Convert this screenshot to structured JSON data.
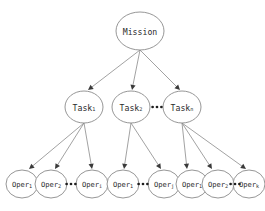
{
  "diagram": {
    "type": "hierarchy-tree",
    "levels": 3,
    "root": {
      "id": "mission",
      "label": "Mission",
      "base": "Mission",
      "sub": "",
      "cx": 140,
      "cy": 31,
      "rx": 24,
      "ry": 19
    },
    "tasks": [
      {
        "id": "task-1",
        "base": "Task",
        "sub": "1",
        "cx": 84,
        "cy": 107,
        "rx": 19,
        "ry": 16
      },
      {
        "id": "task-2",
        "base": "Task",
        "sub": "2",
        "cx": 131,
        "cy": 107,
        "rx": 19,
        "ry": 16
      },
      {
        "id": "task-n",
        "base": "Task",
        "sub": "n",
        "cx": 182,
        "cy": 107,
        "rx": 19,
        "ry": 16
      }
    ],
    "operations": [
      {
        "id": "oper-1-1",
        "base": "Oper",
        "sub": "1",
        "cx": 22,
        "cy": 184,
        "rx": 16,
        "ry": 14,
        "group": 1
      },
      {
        "id": "oper-1-2",
        "base": "Oper",
        "sub": "2",
        "cx": 51,
        "cy": 184,
        "rx": 16,
        "ry": 14,
        "group": 1
      },
      {
        "id": "oper-1-i",
        "base": "Oper",
        "sub": "i",
        "cx": 92,
        "cy": 184,
        "rx": 16,
        "ry": 14,
        "group": 1
      },
      {
        "id": "oper-2-1",
        "base": "Oper",
        "sub": "1",
        "cx": 123,
        "cy": 184,
        "rx": 16,
        "ry": 14,
        "group": 2
      },
      {
        "id": "oper-2-j",
        "base": "Oper",
        "sub": "j",
        "cx": 164,
        "cy": 184,
        "rx": 16,
        "ry": 14,
        "group": 2
      },
      {
        "id": "oper-3-1",
        "base": "Oper",
        "sub": "1",
        "cx": 192,
        "cy": 184,
        "rx": 16,
        "ry": 14,
        "group": 3
      },
      {
        "id": "oper-3-2",
        "base": "Oper",
        "sub": "2",
        "cx": 218,
        "cy": 184,
        "rx": 16,
        "ry": 14,
        "group": 3
      },
      {
        "id": "oper-3-k",
        "base": "Oper",
        "sub": "k",
        "cx": 249,
        "cy": 184,
        "rx": 16,
        "ry": 14,
        "group": 3
      }
    ],
    "ellipses": [
      {
        "id": "ellipsis-tasks",
        "cx": 157,
        "cy": 107,
        "dots": 3
      },
      {
        "id": "ellipsis-oper-1",
        "cx": 71,
        "cy": 184,
        "dots": 3
      },
      {
        "id": "ellipsis-oper-2",
        "cx": 143,
        "cy": 184,
        "dots": 3
      },
      {
        "id": "ellipsis-oper-3",
        "cx": 235,
        "cy": 184,
        "dots": 3
      }
    ],
    "edges": [
      {
        "id": "edge-mission-task-1",
        "from": "mission",
        "to": "task-1",
        "x1": 140,
        "y1": 50,
        "x2": 88,
        "y2": 90
      },
      {
        "id": "edge-mission-task-2",
        "from": "mission",
        "to": "task-2",
        "x1": 140,
        "y1": 50,
        "x2": 132,
        "y2": 90
      },
      {
        "id": "edge-mission-task-n",
        "from": "mission",
        "to": "task-n",
        "x1": 140,
        "y1": 50,
        "x2": 180,
        "y2": 90
      },
      {
        "id": "edge-task-1-oper-1-1",
        "from": "task-1",
        "to": "oper-1-1",
        "x1": 84,
        "y1": 123,
        "x2": 29,
        "y2": 169
      },
      {
        "id": "edge-task-1-oper-1-2",
        "from": "task-1",
        "to": "oper-1-2",
        "x1": 84,
        "y1": 123,
        "x2": 55,
        "y2": 169
      },
      {
        "id": "edge-task-1-oper-1-i",
        "from": "task-1",
        "to": "oper-1-i",
        "x1": 84,
        "y1": 123,
        "x2": 92,
        "y2": 169
      },
      {
        "id": "edge-task-2-oper-2-1",
        "from": "task-2",
        "to": "oper-2-1",
        "x1": 131,
        "y1": 123,
        "x2": 124,
        "y2": 169
      },
      {
        "id": "edge-task-2-oper-2-j",
        "from": "task-2",
        "to": "oper-2-j",
        "x1": 131,
        "y1": 123,
        "x2": 161,
        "y2": 169
      },
      {
        "id": "edge-task-n-oper-3-1",
        "from": "task-n",
        "to": "oper-3-1",
        "x1": 182,
        "y1": 123,
        "x2": 187,
        "y2": 169
      },
      {
        "id": "edge-task-n-oper-3-2",
        "from": "task-n",
        "to": "oper-3-2",
        "x1": 182,
        "y1": 123,
        "x2": 212,
        "y2": 169
      },
      {
        "id": "edge-task-n-oper-3-k",
        "from": "task-n",
        "to": "oper-3-k",
        "x1": 182,
        "y1": 123,
        "x2": 246,
        "y2": 169
      }
    ],
    "colors": {
      "node_stroke": "#8a8a8a",
      "node_fill": "#ffffff",
      "edge_stroke": "#8a8a8a",
      "arrow_fill": "#3a3a3a",
      "label_text": "#2b2b2b",
      "background": "#ffffff"
    }
  }
}
